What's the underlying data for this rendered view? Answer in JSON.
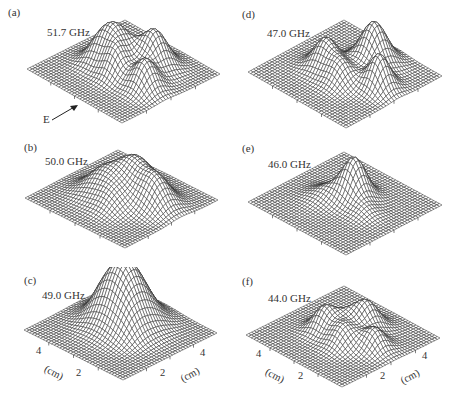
{
  "figure": {
    "panels": [
      {
        "id": "a",
        "label": "(a)",
        "frequency": "51.7 GHz",
        "peaks": [
          [
            0.62,
            0.3,
            0.9,
            0.1
          ],
          [
            0.78,
            0.55,
            0.7,
            0.09
          ],
          [
            0.4,
            0.45,
            0.75,
            0.1
          ],
          [
            0.52,
            0.6,
            0.55,
            0.08
          ],
          [
            0.3,
            0.55,
            0.5,
            0.09
          ]
        ]
      },
      {
        "id": "b",
        "label": "(b)",
        "frequency": "50.0 GHz",
        "peaks": [
          [
            0.5,
            0.35,
            0.85,
            0.12
          ],
          [
            0.75,
            0.4,
            0.75,
            0.11
          ],
          [
            0.35,
            0.55,
            0.6,
            0.12
          ],
          [
            0.55,
            0.65,
            0.35,
            0.1
          ]
        ]
      },
      {
        "id": "c",
        "label": "(c)",
        "frequency": "49.0 GHz",
        "peaks": [
          [
            0.45,
            0.4,
            1.25,
            0.16
          ],
          [
            0.65,
            0.55,
            0.15,
            0.08
          ],
          [
            0.3,
            0.5,
            0.12,
            0.08
          ]
        ]
      },
      {
        "id": "d",
        "label": "(d)",
        "frequency": "47.0 GHz",
        "peaks": [
          [
            0.55,
            0.25,
            1.0,
            0.1
          ],
          [
            0.8,
            0.45,
            0.8,
            0.08
          ],
          [
            0.35,
            0.55,
            0.7,
            0.09
          ],
          [
            0.55,
            0.6,
            0.5,
            0.09
          ]
        ]
      },
      {
        "id": "e",
        "label": "(e)",
        "frequency": "46.0 GHz",
        "peaks": [
          [
            0.5,
            0.4,
            1.0,
            0.09
          ],
          [
            0.7,
            0.5,
            0.2,
            0.08
          ],
          [
            0.35,
            0.55,
            0.25,
            0.1
          ]
        ]
      },
      {
        "id": "f",
        "label": "(f)",
        "frequency": "44.0 GHz",
        "peaks": [
          [
            0.55,
            0.3,
            0.75,
            0.09
          ],
          [
            0.78,
            0.45,
            0.55,
            0.08
          ],
          [
            0.35,
            0.55,
            0.65,
            0.08
          ],
          [
            0.58,
            0.58,
            0.55,
            0.09
          ],
          [
            0.45,
            0.42,
            0.35,
            0.08
          ]
        ]
      }
    ],
    "polarization_label": "E",
    "axes": {
      "unit_left": "(cm)",
      "unit_right": "(cm)",
      "tick_4_left": "4",
      "tick_2_left": "2",
      "tick_2_right": "2",
      "tick_4_right": "4"
    },
    "colors": {
      "line": "#2a2a2a",
      "background": "#ffffff"
    }
  }
}
